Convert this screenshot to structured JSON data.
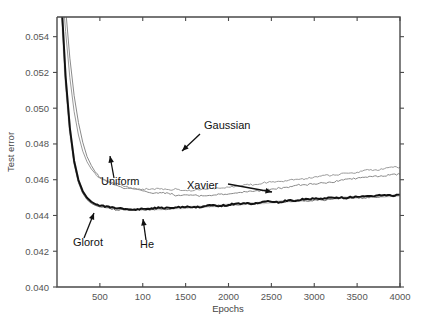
{
  "figure": {
    "background_color": "#ffffff"
  },
  "chart_data": {
    "type": "line",
    "title": "",
    "xlabel": "Epochs",
    "ylabel": "Test error",
    "xlim": [
      0,
      4000
    ],
    "ylim": [
      0.04,
      0.0551
    ],
    "grid": false,
    "legend_position": "inline-annotations",
    "xticks": [
      500,
      1000,
      1500,
      2000,
      2500,
      3000,
      3500,
      4000
    ],
    "xtick_labels": [
      "500",
      "100",
      "1500",
      "2000",
      "2500",
      "3000",
      "3500",
      "4000"
    ],
    "yticks": [
      0.04,
      0.042,
      0.044,
      0.046,
      0.048,
      0.05,
      0.052,
      0.054
    ],
    "ytick_labels": [
      "0.040",
      "0.042",
      "0.044",
      "0.046",
      "0.048",
      "0.050",
      "0.052",
      "0.054"
    ],
    "x": [
      50,
      100,
      150,
      200,
      250,
      300,
      350,
      400,
      450,
      500,
      600,
      700,
      800,
      900,
      1000,
      1100,
      1200,
      1300,
      1400,
      1500,
      1600,
      1700,
      1800,
      1900,
      2000,
      2100,
      2200,
      2300,
      2400,
      2500,
      2600,
      2700,
      2800,
      2900,
      3000,
      3100,
      3200,
      3300,
      3400,
      3500,
      3600,
      3700,
      3800,
      3900,
      4000
    ],
    "series": [
      {
        "name": "Gaussian",
        "color": "#8a8a8a",
        "width": 1.0,
        "values": [
          0.059,
          0.0556,
          0.0528,
          0.0507,
          0.0492,
          0.0481,
          0.0473,
          0.0468,
          0.0464,
          0.04615,
          0.04585,
          0.04568,
          0.04556,
          0.04545,
          0.04538,
          0.0453,
          0.04524,
          0.0452,
          0.04516,
          0.04513,
          0.04512,
          0.04511,
          0.04513,
          0.04516,
          0.0452,
          0.04524,
          0.0453,
          0.04536,
          0.04542,
          0.04548,
          0.04554,
          0.0456,
          0.04565,
          0.0457,
          0.04576,
          0.04583,
          0.04589,
          0.04594,
          0.046,
          0.04606,
          0.04612,
          0.04618,
          0.04623,
          0.04628,
          0.04633
        ]
      },
      {
        "name": "Uniform",
        "color": "#9a9a9a",
        "width": 1.0,
        "values": [
          0.0575,
          0.0543,
          0.0517,
          0.0498,
          0.0485,
          0.0476,
          0.047,
          0.0466,
          0.04632,
          0.04612,
          0.0459,
          0.04576,
          0.04566,
          0.04558,
          0.04552,
          0.04548,
          0.04545,
          0.04543,
          0.04542,
          0.04542,
          0.04543,
          0.04545,
          0.04548,
          0.04552,
          0.04557,
          0.04562,
          0.04568,
          0.04574,
          0.0458,
          0.04586,
          0.04592,
          0.04598,
          0.04604,
          0.0461,
          0.04616,
          0.04622,
          0.04628,
          0.04634,
          0.0464,
          0.04646,
          0.04652,
          0.04657,
          0.04662,
          0.04667,
          0.04672
        ]
      },
      {
        "name": "Xavier",
        "color": "#d0d0d0",
        "width": 2.4,
        "values": [
          0.056,
          0.0516,
          0.0488,
          0.047,
          0.04595,
          0.04533,
          0.04496,
          0.04474,
          0.0446,
          0.04452,
          0.04443,
          0.04438,
          0.04436,
          0.04435,
          0.04435,
          0.04436,
          0.04437,
          0.04439,
          0.04441,
          0.04444,
          0.04447,
          0.0445,
          0.04453,
          0.04456,
          0.04459,
          0.04462,
          0.04465,
          0.04468,
          0.04471,
          0.04474,
          0.04477,
          0.0448,
          0.04483,
          0.04486,
          0.04489,
          0.04492,
          0.04495,
          0.04497,
          0.04499,
          0.04501,
          0.04503,
          0.04505,
          0.04507,
          0.04509,
          0.04511
        ]
      },
      {
        "name": "He",
        "color": "#6e6e6e",
        "width": 1.0,
        "values": [
          0.0558,
          0.0514,
          0.0487,
          0.0469,
          0.04585,
          0.04524,
          0.04489,
          0.04468,
          0.04456,
          0.04448,
          0.0444,
          0.04436,
          0.04434,
          0.04433,
          0.04433,
          0.04434,
          0.04435,
          0.04437,
          0.04439,
          0.04442,
          0.04445,
          0.04448,
          0.04451,
          0.04454,
          0.04457,
          0.0446,
          0.04463,
          0.04466,
          0.04469,
          0.04472,
          0.04475,
          0.04478,
          0.04481,
          0.04484,
          0.04487,
          0.0449,
          0.04493,
          0.04495,
          0.04497,
          0.04499,
          0.04501,
          0.04503,
          0.04505,
          0.04507,
          0.04509
        ]
      },
      {
        "name": "Glorot",
        "color": "#111111",
        "width": 1.9,
        "values": [
          0.0562,
          0.0518,
          0.0489,
          0.04705,
          0.04598,
          0.04536,
          0.04499,
          0.04477,
          0.04463,
          0.04455,
          0.04446,
          0.04441,
          0.04438,
          0.04437,
          0.04437,
          0.04438,
          0.04439,
          0.04441,
          0.04443,
          0.04446,
          0.04449,
          0.04452,
          0.04455,
          0.04458,
          0.04461,
          0.04464,
          0.04467,
          0.0447,
          0.04473,
          0.04476,
          0.04479,
          0.04482,
          0.04485,
          0.04488,
          0.04491,
          0.04494,
          0.04497,
          0.04499,
          0.04501,
          0.04503,
          0.04505,
          0.04507,
          0.04509,
          0.04511,
          0.04513
        ]
      }
    ],
    "annotations": [
      {
        "label": "Gaussian",
        "text_x": 204,
        "text_y": 129,
        "arrow_from_x": 200,
        "arrow_from_y": 134,
        "arrow_to_x": 182,
        "arrow_to_y": 151
      },
      {
        "label": "Uniform",
        "text_x": 101,
        "text_y": 185,
        "arrow_from_x": 114,
        "arrow_from_y": 178,
        "arrow_to_x": 110,
        "arrow_to_y": 156
      },
      {
        "label": "Xavier",
        "text_x": 187,
        "text_y": 189,
        "arrow_from_x": 228,
        "arrow_from_y": 184,
        "arrow_to_x": 272,
        "arrow_to_y": 192
      },
      {
        "label": "Glorot",
        "text_x": 73,
        "text_y": 246,
        "arrow_from_x": 84,
        "arrow_from_y": 238,
        "arrow_to_x": 94,
        "arrow_to_y": 213
      },
      {
        "label": "He",
        "text_x": 140,
        "text_y": 248,
        "arrow_from_x": 146,
        "arrow_from_y": 240,
        "arrow_to_x": 143,
        "arrow_to_y": 219
      }
    ]
  },
  "geometry": {
    "plot_left": 57,
    "plot_right": 400,
    "plot_top": 17,
    "plot_bottom": 287
  }
}
